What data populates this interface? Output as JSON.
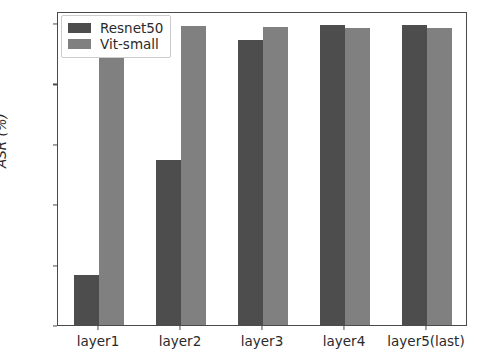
{
  "chart_data": {
    "type": "bar",
    "title": "",
    "xlabel": "",
    "ylabel": "ASR (%)",
    "categories": [
      "layer1",
      "layer2",
      "layer3",
      "layer4",
      "layer5(last)"
    ],
    "series": [
      {
        "name": "Resnet50",
        "color": "#4d4d4d",
        "values": [
          16.5,
          54.5,
          94.5,
          99.5,
          99.5
        ]
      },
      {
        "name": "Vit-small",
        "color": "#808080",
        "values": [
          100.0,
          99.0,
          98.7,
          98.5,
          98.5
        ]
      }
    ],
    "ylim": [
      0,
      104
    ],
    "yticks": [
      0,
      20,
      40,
      60,
      80,
      100
    ],
    "ytick_labels": [
      "0",
      "20",
      "40",
      "60",
      "80",
      "100"
    ],
    "grid": false,
    "legend_position": "upper left",
    "legend_entries": [
      "Resnet50",
      "Vit-small"
    ]
  },
  "figure": {
    "background_color": "#ffffff",
    "axis_color": "#4a4a4a",
    "text_color": "#2a2a2a"
  }
}
